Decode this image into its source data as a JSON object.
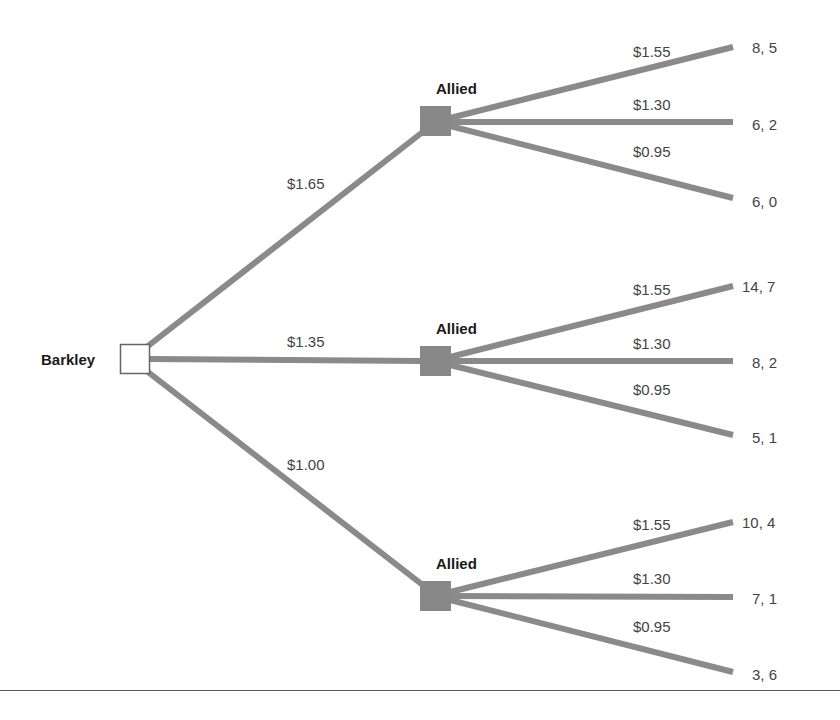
{
  "root": {
    "player": "Barkley"
  },
  "second_mover": "Allied",
  "colors": {
    "branch": "#8a8a8a",
    "node": "#888888",
    "root_fill": "#ffffff",
    "text": "#444444"
  },
  "barkley_moves": [
    {
      "price": "$1.65",
      "allied_label": "Allied",
      "allied_moves": [
        {
          "price": "$1.55",
          "payoff": "8, 5"
        },
        {
          "price": "$1.30",
          "payoff": "6, 2"
        },
        {
          "price": "$0.95",
          "payoff": "6, 0"
        }
      ]
    },
    {
      "price": "$1.35",
      "allied_label": "Allied",
      "allied_moves": [
        {
          "price": "$1.55",
          "payoff": "14, 7"
        },
        {
          "price": "$1.30",
          "payoff": "8, 2"
        },
        {
          "price": "$0.95",
          "payoff": "5, 1"
        }
      ]
    },
    {
      "price": "$1.00",
      "allied_label": "Allied",
      "allied_moves": [
        {
          "price": "$1.55",
          "payoff": "10, 4"
        },
        {
          "price": "$1.30",
          "payoff": "7, 1"
        },
        {
          "price": "$0.95",
          "payoff": "3, 6"
        }
      ]
    }
  ]
}
